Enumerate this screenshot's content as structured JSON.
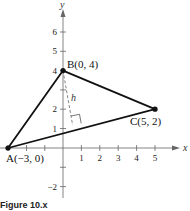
{
  "figure": {
    "caption": "Figure 10.x",
    "axes": {
      "x_label": "x",
      "y_label": "y",
      "x_ticks": [
        "1",
        "2",
        "3",
        "4",
        "5"
      ],
      "y_ticks": [
        "6",
        "5",
        "4",
        "2",
        "1",
        "−2"
      ]
    },
    "points": [
      {
        "name": "A",
        "label": "A(−3, 0)",
        "x": -3,
        "y": 0
      },
      {
        "name": "B",
        "label": "B(0, 4)",
        "x": 0,
        "y": 4
      },
      {
        "name": "C",
        "label": "C(5, 2)",
        "x": 5,
        "y": 2
      }
    ],
    "altitude_label": "h"
  }
}
